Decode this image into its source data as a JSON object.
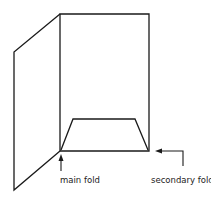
{
  "diagram": {
    "title": "",
    "labels": {
      "main_fold": "main fold",
      "secondary_fold": "secondary fold"
    },
    "stroke_color": "#1a1a1a",
    "background": "#ffffff"
  }
}
